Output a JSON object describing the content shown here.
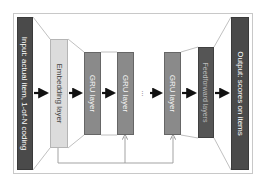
{
  "diagram": {
    "blocks": {
      "input": {
        "label": "Input: actual item, 1-of-N coding"
      },
      "embedding": {
        "label": "Embedding layer"
      },
      "gru1": {
        "label": "GRU layer"
      },
      "gru2": {
        "label": "GRU layer"
      },
      "ellipsis": {
        "label": "..."
      },
      "gru3": {
        "label": "GRU layer"
      },
      "feedforward": {
        "label": "Feedforward layers"
      },
      "output": {
        "label": "Output: scores on items"
      }
    },
    "colors": {
      "dark": "#4a4a4a",
      "light": "#dcdcdc",
      "mid": "#8a8a8a",
      "arrow": "#111111",
      "line": "#a0a0a0"
    }
  }
}
